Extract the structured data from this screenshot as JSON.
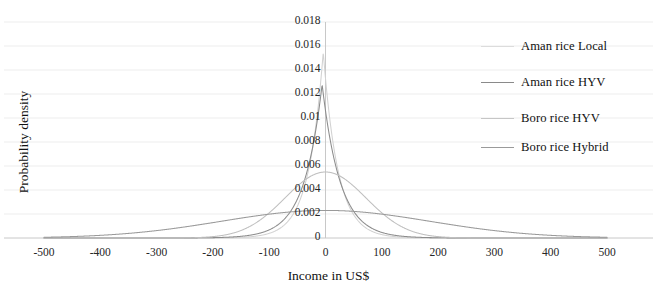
{
  "chart_data": {
    "type": "line",
    "title": "",
    "xlabel": "Income in US$",
    "ylabel": "Probability density",
    "xlim": [
      -500,
      500
    ],
    "ylim": [
      0,
      0.018
    ],
    "grid": true,
    "legend_position": "right",
    "xticks": [
      "-500",
      "-400",
      "-300",
      "-200",
      "-100",
      "0",
      "100",
      "200",
      "300",
      "400",
      "500"
    ],
    "xtick_values": [
      -500,
      -400,
      -300,
      -200,
      -100,
      0,
      100,
      200,
      300,
      400,
      500
    ],
    "yticks": [
      "0",
      "0.002",
      "0.004",
      "0.006",
      "0.008",
      "0.01",
      "0.012",
      "0.014",
      "0.016",
      "0.018"
    ],
    "ytick_values": [
      0,
      0.002,
      0.004,
      0.006,
      0.008,
      0.01,
      0.012,
      0.014,
      0.016,
      0.018
    ],
    "series": [
      {
        "name": "Aman rice Local",
        "color": "#d2d2d2",
        "peak_x": -4,
        "peak_y": 0.0155,
        "sigma": 26,
        "shape": "laplace",
        "x": [
          -500,
          -400,
          -300,
          -200,
          -150,
          -120,
          -100,
          -80,
          -60,
          -50,
          -40,
          -30,
          -20,
          -10,
          -4,
          0,
          10,
          20,
          30,
          40,
          50,
          60,
          80,
          100,
          120,
          150,
          200,
          300,
          400,
          500
        ],
        "y": [
          0.0,
          0.0,
          0.0,
          1e-05,
          2e-05,
          4e-05,
          8e-05,
          0.00018,
          0.0006,
          0.0012,
          0.0024,
          0.0044,
          0.0074,
          0.0118,
          0.0155,
          0.014,
          0.0104,
          0.0072,
          0.0048,
          0.0031,
          0.0019,
          0.0011,
          0.0004,
          0.00014,
          5e-05,
          2e-05,
          1e-05,
          0.0,
          0.0,
          0.0
        ]
      },
      {
        "name": "Aman rice HYV",
        "color": "#8c8c8c",
        "peak_x": -6,
        "peak_y": 0.0128,
        "sigma": 32,
        "shape": "laplace",
        "x": [
          -500,
          -400,
          -300,
          -200,
          -150,
          -120,
          -100,
          -80,
          -60,
          -50,
          -40,
          -30,
          -20,
          -10,
          -6,
          0,
          10,
          20,
          30,
          40,
          50,
          60,
          80,
          100,
          120,
          150,
          200,
          300,
          400,
          500
        ],
        "y": [
          0.0,
          0.0,
          1e-05,
          3e-05,
          6e-05,
          0.00012,
          0.00022,
          0.0005,
          0.0012,
          0.002,
          0.0033,
          0.0052,
          0.0077,
          0.0108,
          0.0128,
          0.0117,
          0.0095,
          0.0072,
          0.0052,
          0.0036,
          0.0024,
          0.0016,
          0.0006,
          0.00023,
          9e-05,
          3e-05,
          1e-05,
          0.0,
          0.0,
          0.0
        ]
      },
      {
        "name": "Boro rice HYV",
        "color": "#bfbfbf",
        "peak_x": 0,
        "peak_y": 0.0055,
        "sigma": 72,
        "shape": "gaussian",
        "x": [
          -500,
          -400,
          -300,
          -250,
          -200,
          -180,
          -150,
          -120,
          -100,
          -80,
          -60,
          -40,
          -20,
          0,
          20,
          40,
          60,
          80,
          100,
          120,
          150,
          180,
          200,
          250,
          300,
          400,
          500
        ],
        "y": [
          0.0,
          0.0,
          2e-05,
          8e-05,
          0.00025,
          0.00045,
          0.001,
          0.0019,
          0.0026,
          0.0034,
          0.0042,
          0.005,
          0.0054,
          0.0055,
          0.0054,
          0.005,
          0.0042,
          0.0034,
          0.0026,
          0.0019,
          0.001,
          0.00045,
          0.00025,
          8e-05,
          2e-05,
          0.0,
          0.0
        ]
      },
      {
        "name": "Boro rice Hybrid",
        "color": "#9a9a9a",
        "peak_x": 0,
        "peak_y": 0.0023,
        "sigma": 185,
        "shape": "gaussian",
        "x": [
          -500,
          -450,
          -400,
          -350,
          -300,
          -250,
          -200,
          -150,
          -100,
          -50,
          0,
          50,
          100,
          150,
          200,
          250,
          300,
          350,
          400,
          450,
          500
        ],
        "y": [
          5e-05,
          0.00012,
          0.00025,
          0.00045,
          0.00075,
          0.0011,
          0.0015,
          0.0018,
          0.0021,
          0.0022,
          0.0023,
          0.0022,
          0.0021,
          0.0018,
          0.0015,
          0.0011,
          0.00075,
          0.00045,
          0.00025,
          0.00012,
          5e-05
        ]
      }
    ]
  },
  "axes": {
    "y_title": "Probability density",
    "x_title": "Income in US$"
  },
  "legend": {
    "items": [
      {
        "label": "Aman rice Local",
        "color": "#dcdcdc"
      },
      {
        "label": "Aman rice HYV",
        "color": "#8a8a8a"
      },
      {
        "label": "Boro rice HYV",
        "color": "#c6c6c6"
      },
      {
        "label": "Boro rice Hybrid",
        "color": "#9a9a9a"
      }
    ]
  },
  "style": {
    "grid_color": "#ededed",
    "axis_color": "#c8c8c8",
    "text_color": "#262626"
  }
}
